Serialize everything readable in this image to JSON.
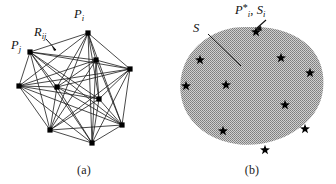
{
  "figure": {
    "background_color": "#ffffff",
    "width": 336,
    "height": 184
  },
  "panels": [
    {
      "id": "a",
      "caption": "(a)",
      "type": "complete-graph",
      "description": "Fully connected network of nodes",
      "node_color": "#000000",
      "edge_color": "#1a1a1a",
      "labels": {
        "node_i": {
          "base": "P",
          "sub": "i"
        },
        "edge_ij": {
          "base": "R",
          "sub": "ij"
        },
        "node_j": {
          "base": "P",
          "sub": "j"
        }
      },
      "nodes": [
        {
          "name": "P_i",
          "x": 88,
          "y": 33
        },
        {
          "name": "n2",
          "x": 96,
          "y": 60
        },
        {
          "name": "n3",
          "x": 130,
          "y": 69
        },
        {
          "name": "P_j",
          "x": 30,
          "y": 52
        },
        {
          "name": "n5",
          "x": 19,
          "y": 86
        },
        {
          "name": "n6",
          "x": 57,
          "y": 87
        },
        {
          "name": "n7",
          "x": 50,
          "y": 130
        },
        {
          "name": "n8",
          "x": 92,
          "y": 143
        },
        {
          "name": "n9",
          "x": 122,
          "y": 125
        },
        {
          "name": "n10",
          "x": 99,
          "y": 99
        }
      ]
    },
    {
      "id": "b",
      "caption": "(b)",
      "type": "region-with-points",
      "description": "Shaded region S containing selected points",
      "region_fill_color": "#a8a8a8",
      "region_pattern": "stipple",
      "marker_color": "#000000",
      "marker_shape": "star",
      "labels": {
        "region": {
          "base": "S"
        },
        "point": {
          "base": "P",
          "sub": "i",
          "sup": "*",
          "separator": ", ",
          "second_base": "S",
          "second_sub": "i"
        }
      },
      "points": [
        {
          "x": 88,
          "y": 32
        },
        {
          "x": 32,
          "y": 60
        },
        {
          "x": 18,
          "y": 86
        },
        {
          "x": 58,
          "y": 85
        },
        {
          "x": 113,
          "y": 58
        },
        {
          "x": 142,
          "y": 73
        },
        {
          "x": 117,
          "y": 105
        },
        {
          "x": 55,
          "y": 131
        },
        {
          "x": 137,
          "y": 129
        },
        {
          "x": 97,
          "y": 150
        }
      ]
    }
  ]
}
